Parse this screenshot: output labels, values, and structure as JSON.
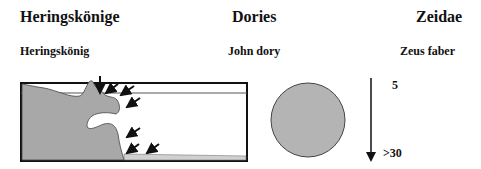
{
  "headers": {
    "col1": "Heringskönige",
    "col2": "Dories",
    "col3": "Zeidae"
  },
  "subheaders": {
    "col1": "Heringskönig",
    "col2": "John dory",
    "col3": "Zeus faber"
  },
  "depth_scale": {
    "top_label": "5",
    "bottom_label": ">30"
  },
  "colors": {
    "fill_grey": "#a8a8a8",
    "seabed_light": "#d0d0d0",
    "stroke": "#111111"
  }
}
